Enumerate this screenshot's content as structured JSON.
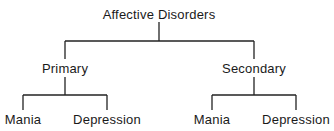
{
  "diagram": {
    "type": "tree",
    "root": {
      "label": "Affective Disorders",
      "children": [
        {
          "label": "Primary",
          "children": [
            {
              "label": "Mania"
            },
            {
              "label": "Depression"
            }
          ]
        },
        {
          "label": "Secondary",
          "children": [
            {
              "label": "Mania"
            },
            {
              "label": "Depression"
            }
          ]
        }
      ]
    }
  }
}
